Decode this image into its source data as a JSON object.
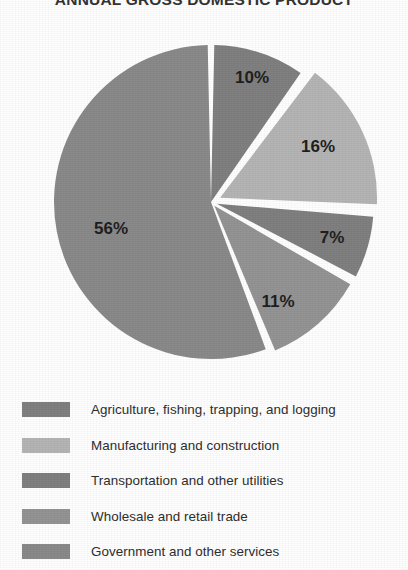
{
  "chart_data": {
    "type": "pie",
    "title": "ANNUAL GROSS DOMESTIC PRODUCT",
    "categories": [
      "Agriculture, fishing, trapping, and logging",
      "Manufacturing and construction",
      "Transportation and other utilities",
      "Wholesale and retail trade",
      "Government and other services"
    ],
    "values": [
      10,
      16,
      7,
      11,
      56
    ],
    "value_labels": [
      "10%",
      "16%",
      "7%",
      "11%",
      "56%"
    ],
    "colors": [
      "#808080",
      "#b5b5b5",
      "#808080",
      "#949494",
      "#8a8a8a"
    ],
    "unit": "percent",
    "total": 100,
    "legend_position": "bottom",
    "grid": false,
    "xlabel": "",
    "ylabel": ""
  },
  "legend": {
    "items": [
      {
        "label": "Agriculture, fishing, trapping, and logging",
        "color": "#808080",
        "value_label": "10%"
      },
      {
        "label": "Manufacturing and construction",
        "color": "#b5b5b5",
        "value_label": "16%"
      },
      {
        "label": "Transportation and other utilities",
        "color": "#808080",
        "value_label": "7%"
      },
      {
        "label": "Wholesale and retail trade",
        "color": "#949494",
        "value_label": "11%"
      },
      {
        "label": "Government and other services",
        "color": "#8a8a8a",
        "value_label": "56%"
      }
    ]
  },
  "geometry": {
    "center_x": 211,
    "center_y": 202,
    "radius": 157,
    "gap_degrees": 2.4,
    "start_angle_degrees": -90,
    "explode": [
      0,
      10,
      6,
      5,
      0
    ]
  },
  "label_positions": [
    {
      "text": "10%",
      "x": 252,
      "y": 79
    },
    {
      "text": "16%",
      "x": 318,
      "y": 148
    },
    {
      "text": "7%",
      "x": 332,
      "y": 239
    },
    {
      "text": "11%",
      "x": 278,
      "y": 303
    },
    {
      "text": "56%",
      "x": 111,
      "y": 230
    }
  ]
}
